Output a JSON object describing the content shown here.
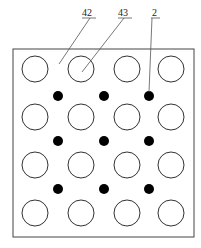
{
  "diagram": {
    "labels": [
      {
        "id": "label-42",
        "text": "42",
        "x": 82,
        "y": 16,
        "line": [
          90,
          18,
          59,
          64
        ],
        "underline": [
          82,
          18,
          96,
          18
        ]
      },
      {
        "id": "label-43",
        "text": "43",
        "x": 118,
        "y": 16,
        "line": [
          124,
          18,
          82,
          72
        ],
        "underline": [
          118,
          18,
          132,
          18
        ]
      },
      {
        "id": "label-2",
        "text": "2",
        "x": 152,
        "y": 16,
        "line": [
          152,
          18,
          149,
          92
        ],
        "underline": [
          151,
          18,
          160,
          18
        ]
      }
    ],
    "frame": {
      "x": 13,
      "y": 49,
      "width": 181,
      "height": 188
    },
    "hollow_circles": {
      "cols": [
        35,
        81,
        127,
        171
      ],
      "rows": [
        69,
        117,
        165,
        213
      ],
      "r": 13
    },
    "solid_dots": {
      "cols": [
        58,
        104,
        149
      ],
      "rows": [
        96,
        141,
        189
      ],
      "r": 5
    },
    "colors": {
      "stroke": "#333333",
      "fill_dot": "#000000"
    }
  }
}
